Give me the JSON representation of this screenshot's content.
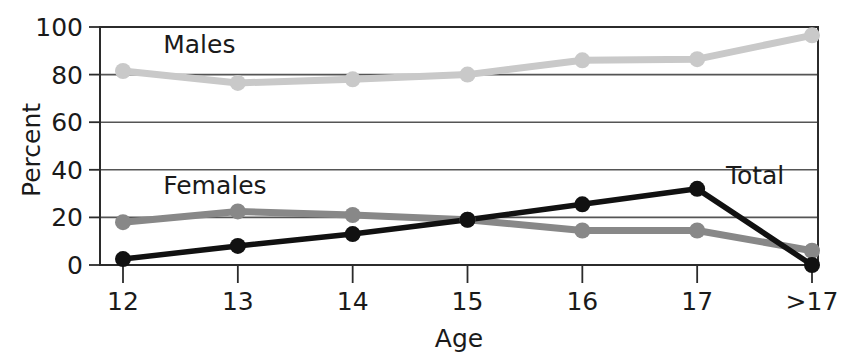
{
  "chart_data": {
    "type": "line",
    "title": "",
    "xlabel": "Age",
    "ylabel": "Percent",
    "categories": [
      "12",
      "13",
      "14",
      "15",
      "16",
      "17",
      ">17"
    ],
    "ylim": [
      0,
      100
    ],
    "yticks": [
      "0",
      "20",
      "40",
      "60",
      "80",
      "100"
    ],
    "ytick_values": [
      0,
      20,
      40,
      60,
      80,
      100
    ],
    "grid": "horizontal",
    "legend_position": "inline-annotations",
    "series": [
      {
        "name": "Males",
        "color": "#c9c9c9",
        "label_x": "12.35",
        "label_y": "89",
        "values": [
          81.5,
          76.5,
          78,
          80,
          86,
          86.5,
          96.5
        ]
      },
      {
        "name": "Females",
        "color": "#888888",
        "label_x": "12.35",
        "label_y": "30",
        "values": [
          18,
          22.5,
          21,
          19,
          14.5,
          14.5,
          6
        ]
      },
      {
        "name": "Total",
        "color": "#111111",
        "label_x": "17.25",
        "label_y": "34",
        "values": [
          2.5,
          8,
          13,
          19,
          25.5,
          32,
          0
        ]
      }
    ]
  },
  "axes": {
    "y_axis_title": "Percent",
    "x_axis_title": "Age"
  },
  "colors": {
    "males": "#c9c9c9",
    "females": "#888888",
    "total": "#111111",
    "axis": "#2b2b2b",
    "grid": "#555555",
    "background": "#ffffff"
  }
}
